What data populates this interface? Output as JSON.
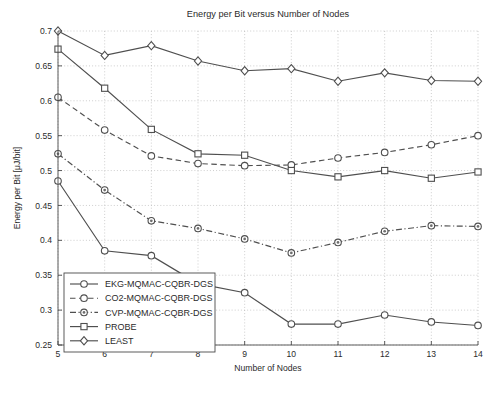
{
  "chart_data": {
    "type": "line",
    "title": "Energy per Bit versus Number of Nodes",
    "xlabel": "Number of Nodes",
    "ylabel": "Energy per Bit [μJ/bit]",
    "x": [
      5,
      6,
      7,
      8,
      9,
      10,
      11,
      12,
      13,
      14
    ],
    "xlim": [
      5,
      14
    ],
    "ylim": [
      0.25,
      0.7
    ],
    "xticks": [
      "5",
      "6",
      "7",
      "8",
      "9",
      "10",
      "11",
      "12",
      "13",
      "14"
    ],
    "yticks": [
      "0.25",
      "0.3",
      "0.35",
      "0.4",
      "0.45",
      "0.5",
      "0.55",
      "0.6",
      "0.65",
      "0.7"
    ],
    "ytick_values": [
      0.25,
      0.3,
      0.35,
      0.4,
      0.45,
      0.5,
      0.55,
      0.6,
      0.65,
      0.7
    ],
    "grid": true,
    "legend_position": "lower left",
    "series": [
      {
        "name": "EKG-MQMAC-CQBR-DGS",
        "marker": "circle",
        "linestyle": "solid",
        "values": [
          0.485,
          0.385,
          0.378,
          0.338,
          0.325,
          0.28,
          0.28,
          0.293,
          0.283,
          0.278
        ]
      },
      {
        "name": "CO2-MQMAC-CQBR-DGS",
        "marker": "circle",
        "linestyle": "dashed",
        "values": [
          0.605,
          0.558,
          0.521,
          0.51,
          0.507,
          0.508,
          0.518,
          0.526,
          0.537,
          0.55
        ]
      },
      {
        "name": "CVP-MQMAC-CQBR-DGS",
        "marker": "circle-dot",
        "linestyle": "dashdot",
        "values": [
          0.524,
          0.472,
          0.428,
          0.417,
          0.402,
          0.382,
          0.397,
          0.413,
          0.421,
          0.42
        ]
      },
      {
        "name": "PROBE",
        "marker": "square",
        "linestyle": "solid",
        "values": [
          0.674,
          0.618,
          0.559,
          0.524,
          0.522,
          0.5,
          0.491,
          0.5,
          0.489,
          0.498
        ]
      },
      {
        "name": "LEAST",
        "marker": "diamond",
        "linestyle": "solid",
        "values": [
          0.7,
          0.665,
          0.679,
          0.657,
          0.643,
          0.646,
          0.628,
          0.64,
          0.629,
          0.628
        ]
      }
    ]
  }
}
